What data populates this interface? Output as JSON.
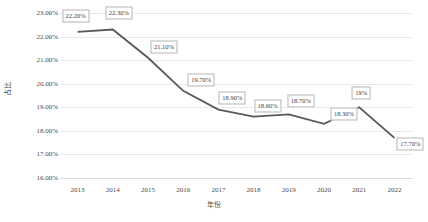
{
  "chart_data": {
    "type": "line",
    "title": "",
    "xlabel": "年份",
    "ylabel": "占比",
    "categories": [
      "2013",
      "2014",
      "2015",
      "2016",
      "2017",
      "2018",
      "2019",
      "2020",
      "2021",
      "2022"
    ],
    "values": [
      22.2,
      22.3,
      21.1,
      19.7,
      18.9,
      18.6,
      18.7,
      18.3,
      19.0,
      17.7
    ],
    "point_labels": [
      "22.20%",
      "22.30%",
      "21.10%",
      "19.70%",
      "18.90%",
      "18.60%",
      "18.70%",
      "18.30%",
      "19%",
      "17.70%"
    ],
    "ylim": [
      16.0,
      23.0
    ],
    "ytick_values": [
      23.0,
      22.0,
      21.0,
      20.0,
      19.0,
      18.0,
      17.0,
      16.0
    ],
    "ytick_labels": [
      "23.00%",
      "22.00%",
      "21.00%",
      "20.00%",
      "19.00%",
      "18.00%",
      "17.00%",
      "16.00%"
    ],
    "grid": true,
    "legend": "none",
    "series_color": "#595959",
    "grid_color": "#e8e8e8",
    "label_border_color": "#b5b5b5",
    "text_color": "#4a4a4a"
  },
  "bottom_caption": ""
}
